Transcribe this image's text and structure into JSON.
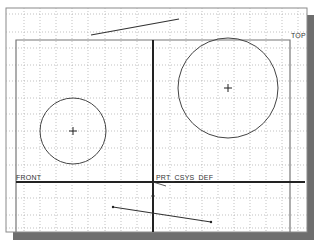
{
  "canvas": {
    "background": "#ffffff",
    "grid_color": "#9a9a9a",
    "frame_color": "#7a7a7a",
    "shadow_color": "#6e6e6e",
    "line_color": "#444444"
  },
  "datum_planes": {
    "top": {
      "label": "TOP"
    },
    "front": {
      "label": "FRONT"
    }
  },
  "coordinate_system": {
    "label": "PRT_CSYS_DEF"
  },
  "sketch": {
    "circles": [
      {
        "name": "small-circle",
        "cx": 73,
        "cy": 131,
        "r": 33
      },
      {
        "name": "large-circle",
        "cx": 228,
        "cy": 88,
        "r": 50
      }
    ],
    "lines": [
      {
        "name": "upper-line",
        "x1": 91,
        "y1": 35,
        "x2": 179,
        "y2": 19
      },
      {
        "name": "lower-line",
        "x1": 113,
        "y1": 207,
        "x2": 211,
        "y2": 222
      }
    ]
  }
}
